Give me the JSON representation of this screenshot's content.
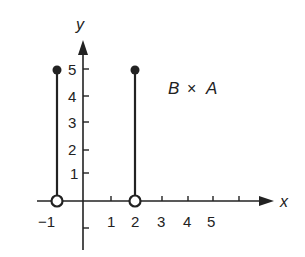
{
  "diagram": {
    "title": "B × A",
    "label": {
      "left": "B",
      "operator": "×",
      "right": "A"
    },
    "axes": {
      "x_label": "x",
      "y_label": "y",
      "x_ticks": [
        {
          "value": -1,
          "label": "−1"
        },
        {
          "value": 1,
          "label": "1"
        },
        {
          "value": 2,
          "label": "2"
        },
        {
          "value": 3,
          "label": "3"
        },
        {
          "value": 4,
          "label": "4"
        },
        {
          "value": 5,
          "label": "5"
        },
        {
          "value": 6,
          "label": ""
        }
      ],
      "y_ticks": [
        {
          "value": 1,
          "label": "1"
        },
        {
          "value": 2,
          "label": "2"
        },
        {
          "value": 3,
          "label": "3"
        },
        {
          "value": 4,
          "label": "4"
        },
        {
          "value": 5,
          "label": "5"
        },
        {
          "value": -1,
          "label": ""
        }
      ]
    },
    "segments": [
      {
        "x": -1,
        "y_from": 0,
        "y_to": 5,
        "bottom_endpoint": "open",
        "top_endpoint": "closed"
      },
      {
        "x": 2,
        "y_from": 0,
        "y_to": 5,
        "bottom_endpoint": "open",
        "top_endpoint": "closed"
      }
    ],
    "colors": {
      "ink": "#222222",
      "background": "#ffffff"
    }
  }
}
